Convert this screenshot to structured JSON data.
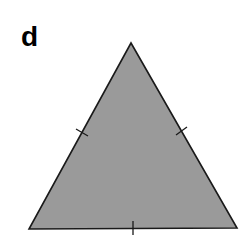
{
  "figure": {
    "panel_label": "d",
    "shape": "equilateral-triangle",
    "fill_color": "#9a9a9a",
    "stroke_color": "#1a1a1a",
    "vertices": [
      [
        131,
        43
      ],
      [
        29,
        229
      ],
      [
        237,
        228
      ]
    ],
    "tick_marks": [
      {
        "side": "left",
        "from": [
          76,
          129
        ],
        "to": [
          88,
          136
        ]
      },
      {
        "side": "right",
        "from": [
          176,
          135
        ],
        "to": [
          187,
          127
        ]
      },
      {
        "side": "bottom",
        "from": [
          133,
          221
        ],
        "to": [
          133,
          235
        ]
      }
    ]
  }
}
